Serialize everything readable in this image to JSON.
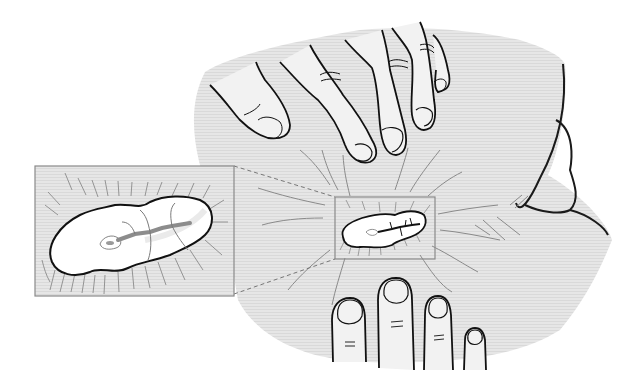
{
  "figure": {
    "type": "medical-line-illustration",
    "components": [
      {
        "name": "skin-region",
        "role": "gray textured skin area"
      },
      {
        "name": "upper-hand",
        "role": "fingers pressing/pulling skin from above"
      },
      {
        "name": "lower-hand",
        "role": "four fingertips pressing skin from below"
      },
      {
        "name": "wound",
        "role": "small central wound with dark fissure and radiating tension lines"
      },
      {
        "name": "detail-frame",
        "role": "small rectangle framing the wound"
      },
      {
        "name": "inset-magnification",
        "role": "enlarged rectangular view of the wound at left"
      },
      {
        "name": "dashed-leader-lines",
        "role": "dashed lines connecting the frame to the inset"
      },
      {
        "name": "right-shoulder-outline",
        "role": "outline of a body contour on the right"
      }
    ]
  },
  "colors": {
    "background": "#ffffff",
    "skin": "#e4e4e4",
    "skin_texture": "#d6d6d6",
    "finger_fill": "#f2f2f2",
    "outline": "#1a1a1a",
    "thin_lines": "#7a7a7a",
    "wound_fill": "#ffffff",
    "fissure": "#8c8c8c",
    "frame": "#8a8a8a"
  }
}
